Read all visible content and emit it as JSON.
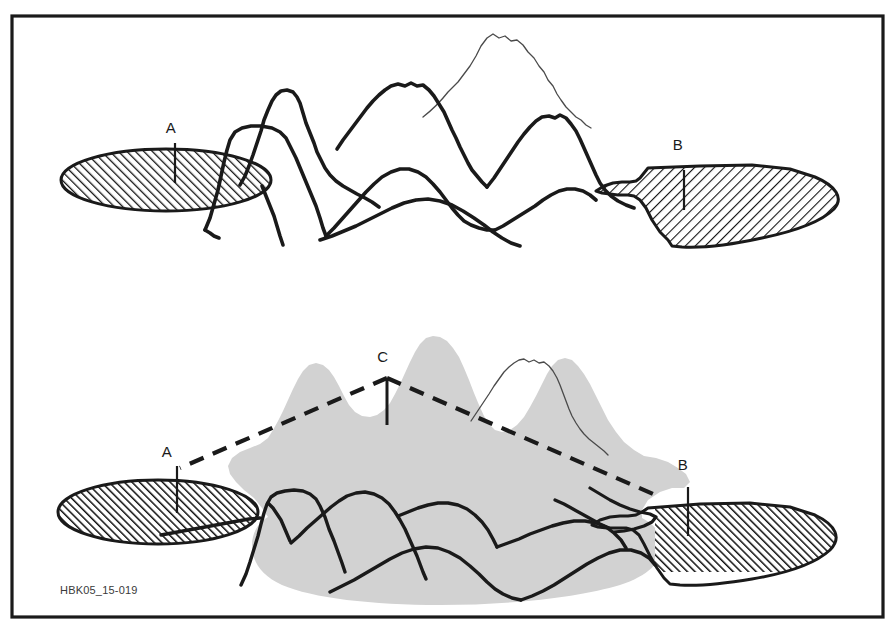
{
  "figure": {
    "caption": "HBK05_15-019",
    "frame": {
      "stroke_color": "#1a1a1a",
      "x": 12,
      "y": 16,
      "width": 871,
      "height": 601
    },
    "background_color": "#ffffff",
    "panels": [
      {
        "id": "upper-panel",
        "name": "without-relay",
        "description": "Two isolated antenna coverage footprints blocked by intervening mountain range",
        "labels": [
          {
            "id": "A",
            "text": "A",
            "x": 171,
            "y": 133,
            "mast_x": 175,
            "mast_y1": 143,
            "mast_y2": 183
          },
          {
            "id": "B",
            "text": "B",
            "x": 678,
            "y": 138,
            "mast_x": 684,
            "mast_y1": 170,
            "mast_y2": 210
          }
        ],
        "footprints": [
          {
            "id": "A",
            "fill": "hatch-up",
            "cx": 166,
            "cy": 180,
            "rx": 105,
            "ry": 31
          },
          {
            "id": "B",
            "fill": "hatch-down",
            "cx": 742,
            "cy": 192,
            "rx": 100,
            "ry": 37
          }
        ]
      },
      {
        "id": "lower-panel",
        "name": "with-relay",
        "description": "Relay station C on summit links footprints A and B; combined gray coverage area",
        "labels": [
          {
            "id": "C",
            "text": "C",
            "x": 383,
            "y": 362,
            "mast_x": 387,
            "mast_y1": 378,
            "mast_y2": 425
          },
          {
            "id": "A",
            "text": "A",
            "x": 167,
            "y": 452,
            "mast_x": 177,
            "mast_y1": 466,
            "mast_y2": 513
          },
          {
            "id": "B",
            "text": "B",
            "x": 683,
            "y": 460,
            "mast_x": 688,
            "mast_y1": 487,
            "mast_y2": 536
          }
        ],
        "sight_lines": [
          {
            "from": "C",
            "to": "A",
            "style": "dashed"
          },
          {
            "from": "C",
            "to": "B",
            "style": "dashed"
          }
        ],
        "coverage": {
          "fill": "#d2d2d2",
          "label": "combined-coverage-area"
        },
        "footprints": [
          {
            "id": "A",
            "fill": "hatch-up",
            "cx": 158,
            "cy": 512,
            "rx": 100,
            "ry": 32
          },
          {
            "id": "B",
            "fill": "hatch-up",
            "cx": 745,
            "cy": 530,
            "rx": 98,
            "ry": 38
          }
        ]
      }
    ],
    "colors": {
      "ink": "#1a1a1a",
      "thin_ink": "#4a4a4a",
      "coverage_gray": "#d2d2d2",
      "hatch": "#111111",
      "paper": "#ffffff"
    }
  }
}
